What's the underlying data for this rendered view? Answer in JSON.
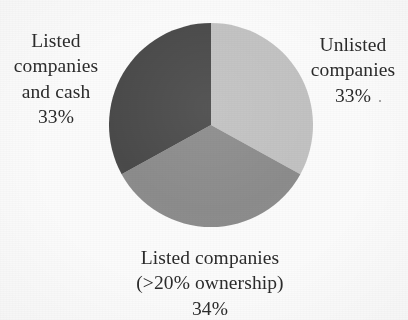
{
  "figure": {
    "background_color": "#fbfbfb",
    "text_color": "#2b2b2b"
  },
  "chart_data": {
    "type": "pie",
    "title": "",
    "subtitle": "",
    "xlabel": "",
    "ylabel": "",
    "legend_position": "none",
    "labels_position": "outside",
    "start_angle_deg": 0,
    "direction": "clockwise",
    "categories": [
      "Unlisted companies",
      "Listed companies (>20% ownership)",
      "Listed companies and cash"
    ],
    "values": [
      33,
      34,
      33
    ],
    "value_unit": "%",
    "colors": [
      "#c2c2c2",
      "#8c8c8c",
      "#4a4a4a"
    ],
    "slices": [
      {
        "name": "Unlisted companies",
        "label_lines": [
          "Unlisted",
          "companies",
          "33%"
        ],
        "value": 33,
        "value_text": "33%",
        "color": "#c2c2c2",
        "start_deg": 0,
        "end_deg": 118.8
      },
      {
        "name": "Listed companies (>20% ownership)",
        "label_lines": [
          "Listed companies",
          "(>20% ownership)",
          "34%"
        ],
        "value": 34,
        "value_text": "34%",
        "color": "#8c8c8c",
        "start_deg": 118.8,
        "end_deg": 241.2
      },
      {
        "name": "Listed companies and cash",
        "label_lines": [
          "Listed",
          "companies",
          "and cash",
          "33%"
        ],
        "value": 33,
        "value_text": "33%",
        "color": "#4a4a4a",
        "start_deg": 241.2,
        "end_deg": 360
      }
    ]
  },
  "labels": {
    "left": {
      "line1": "Listed",
      "line2": "companies",
      "line3": "and cash",
      "line4": "33%"
    },
    "right": {
      "line1": "Unlisted",
      "line2": "companies",
      "line3": "33%"
    },
    "bottom": {
      "line1": "Listed companies",
      "line2": "(>20% ownership)",
      "line3": "34%"
    }
  }
}
